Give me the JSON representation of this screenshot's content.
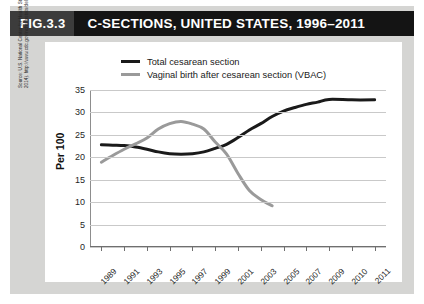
{
  "header": {
    "fig_number": "FIG.3.3",
    "title": "C-SECTIONS, UNITED STATES, 1996–2011"
  },
  "source_note": "Source: U.S. National Center for Health Statistics (page last updated February 25, 2014). http://www.cdc.gov/nchs/fastats/delivery.htm (Accessed September 16, 2014)",
  "colors": {
    "title_bar": "#141414",
    "fig_number_bg": "#3c3c3c",
    "page_panel": "#d5d5d3",
    "card": "#ffffff",
    "total_cesarean": "#1a1a1a",
    "vbac": "#9a9a9a",
    "gridline": "#c9c9c9",
    "axis": "#6f6f6f"
  },
  "chart_data": {
    "type": "line",
    "title": "C-SECTIONS, UNITED STATES, 1996–2011",
    "xlabel": "Year",
    "ylabel": "Per 100",
    "ylim": [
      0,
      35
    ],
    "yticks": [
      0,
      5,
      10,
      15,
      20,
      25,
      30,
      35
    ],
    "ytick_labels": [
      "0",
      "5",
      "10",
      "15",
      "20",
      "25",
      "30",
      "35"
    ],
    "grid": true,
    "legend_position": "top-center",
    "xlim": [
      1989,
      2011
    ],
    "xtick_labels": [
      "1989",
      "1991",
      "1993",
      "1995",
      "1997",
      "1999",
      "2001",
      "2003",
      "2005",
      "2007",
      "2009",
      "2010",
      "2011"
    ],
    "xtick_years": [
      1989,
      1991,
      1993,
      1995,
      1997,
      1999,
      2001,
      2003,
      2005,
      2007,
      2009,
      2010,
      2011
    ],
    "series": [
      {
        "name": "Total cesarean section",
        "color": "#1a1a1a",
        "x": [
          1989,
          1990,
          1991,
          1992,
          1993,
          1994,
          1995,
          1996,
          1997,
          1998,
          1999,
          2000,
          2001,
          2002,
          2003,
          2004,
          2005,
          2006,
          2007,
          2008,
          2009,
          2010,
          2011
        ],
        "values": [
          22.8,
          22.7,
          22.6,
          22.3,
          21.8,
          21.2,
          20.8,
          20.7,
          20.8,
          21.2,
          22.0,
          22.9,
          24.4,
          26.1,
          27.5,
          29.1,
          30.3,
          31.1,
          31.8,
          32.3,
          32.9,
          32.8,
          32.8
        ]
      },
      {
        "name": "Vaginal birth after cesarean section (VBAC)",
        "color": "#9a9a9a",
        "x": [
          1989,
          1990,
          1991,
          1992,
          1993,
          1994,
          1995,
          1996,
          1997,
          1998,
          1999,
          2000,
          2001,
          2002,
          2003,
          2004
        ],
        "values": [
          18.9,
          20.4,
          21.8,
          23.0,
          24.3,
          26.3,
          27.5,
          28.0,
          27.4,
          26.3,
          23.4,
          20.7,
          16.4,
          12.6,
          10.6,
          9.2
        ]
      }
    ]
  },
  "legend": [
    {
      "label": "Total cesarean section",
      "color": "#1a1a1a"
    },
    {
      "label": "Vaginal birth after cesarean section (VBAC)",
      "color": "#9a9a9a"
    }
  ]
}
